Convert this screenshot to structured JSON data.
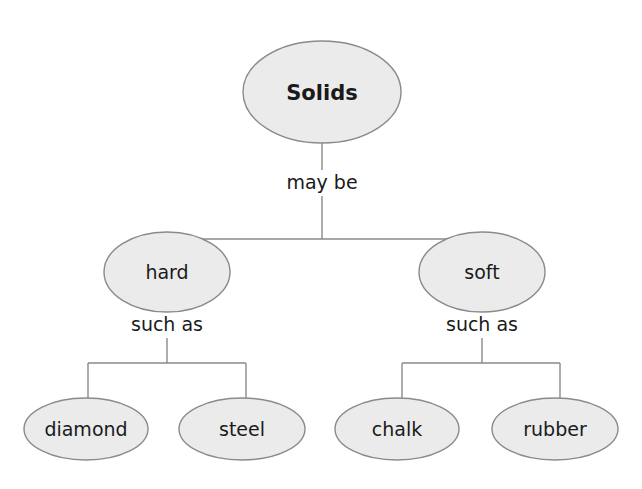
{
  "diagram": {
    "type": "concept-map",
    "root": {
      "label": "Solids"
    },
    "root_link_label": "may be",
    "branches": [
      {
        "label": "hard",
        "link_label": "such as",
        "children": [
          {
            "label": "diamond"
          },
          {
            "label": "steel"
          }
        ]
      },
      {
        "label": "soft",
        "link_label": "such as",
        "children": [
          {
            "label": "chalk"
          },
          {
            "label": "rubber"
          }
        ]
      }
    ]
  },
  "colors": {
    "node_fill": "#ebebeb",
    "node_stroke": "#8a8a8a",
    "line": "#8a8a8a",
    "text": "#1a1a1a"
  }
}
